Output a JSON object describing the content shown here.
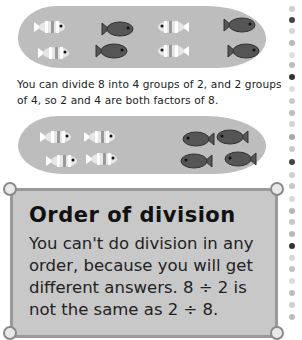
{
  "illustration_top": {
    "description": "8 fish in a pond: 4 striped and 4 dark, arranged as 4 groups of 2",
    "fish": [
      {
        "type": "striped",
        "x": 32,
        "y": 18,
        "dir": "right"
      },
      {
        "type": "dark",
        "x": 100,
        "y": 20,
        "dir": "right"
      },
      {
        "type": "striped",
        "x": 155,
        "y": 18,
        "dir": "left"
      },
      {
        "type": "dark",
        "x": 222,
        "y": 16,
        "dir": "right"
      },
      {
        "type": "striped",
        "x": 36,
        "y": 44,
        "dir": "right"
      },
      {
        "type": "dark",
        "x": 94,
        "y": 42,
        "dir": "right"
      },
      {
        "type": "striped",
        "x": 155,
        "y": 42,
        "dir": "left"
      },
      {
        "type": "dark",
        "x": 226,
        "y": 42,
        "dir": "right"
      }
    ]
  },
  "caption": "You can divide 8 into 4 groups of 2, and 2 groups of 4, so 2 and 4 are both factors of 8.",
  "illustration_bottom": {
    "description": "8 fish in a pond: 4 striped fish on left, 4 dark fish on right, as 2 groups of 4",
    "fish": [
      {
        "type": "striped",
        "x": 38,
        "y": 128,
        "dir": "right"
      },
      {
        "type": "striped",
        "x": 82,
        "y": 128,
        "dir": "right"
      },
      {
        "type": "dark",
        "x": 180,
        "y": 130,
        "dir": "left"
      },
      {
        "type": "dark",
        "x": 214,
        "y": 128,
        "dir": "left"
      },
      {
        "type": "striped",
        "x": 44,
        "y": 152,
        "dir": "right"
      },
      {
        "type": "striped",
        "x": 84,
        "y": 150,
        "dir": "right"
      },
      {
        "type": "dark",
        "x": 178,
        "y": 152,
        "dir": "left"
      },
      {
        "type": "dark",
        "x": 222,
        "y": 150,
        "dir": "left"
      }
    ]
  },
  "info_panel": {
    "title": "Order of division",
    "body": "You can't do division in any order, because you will get different answers. 8 ÷ 2 is not the same as 2 ÷ 8."
  },
  "colors": {
    "pond": "#bdbdbd",
    "panel": "#c8c8c8",
    "dark_fish": "#555555",
    "striped_fish": "#e6e6e6"
  },
  "dot_column": [
    {
      "y": 6,
      "c": "#cfcfcf"
    },
    {
      "y": 17,
      "c": "#444"
    },
    {
      "y": 28,
      "c": "#d8d8d8"
    },
    {
      "y": 40,
      "c": "#b8b8b8"
    },
    {
      "y": 52,
      "c": "#e0e0e0"
    },
    {
      "y": 62,
      "c": "#bcbcbc"
    },
    {
      "y": 74,
      "c": "#333"
    },
    {
      "y": 86,
      "c": "#dedede"
    },
    {
      "y": 98,
      "c": "#cacaca"
    },
    {
      "y": 110,
      "c": "#bdbdbd"
    },
    {
      "y": 121,
      "c": "#d5d5d5"
    },
    {
      "y": 134,
      "c": "#a8a8a8"
    },
    {
      "y": 146,
      "c": "#c8c8c8"
    },
    {
      "y": 159,
      "c": "#444"
    },
    {
      "y": 172,
      "c": "#cfcfcf"
    },
    {
      "y": 183,
      "c": "#c8c8c8"
    },
    {
      "y": 196,
      "c": "#dadada"
    },
    {
      "y": 208,
      "c": "#b5b5b5"
    },
    {
      "y": 219,
      "c": "#c8c8c8"
    },
    {
      "y": 231,
      "c": "#b8b8b8"
    },
    {
      "y": 243,
      "c": "#333"
    },
    {
      "y": 255,
      "c": "#d8d8d8"
    },
    {
      "y": 266,
      "c": "#c3c3c3"
    },
    {
      "y": 278,
      "c": "#dcdcdc"
    },
    {
      "y": 290,
      "c": "#bcbcbc"
    },
    {
      "y": 302,
      "c": "#cfcfcf"
    },
    {
      "y": 314,
      "c": "#bdbdbd"
    }
  ]
}
